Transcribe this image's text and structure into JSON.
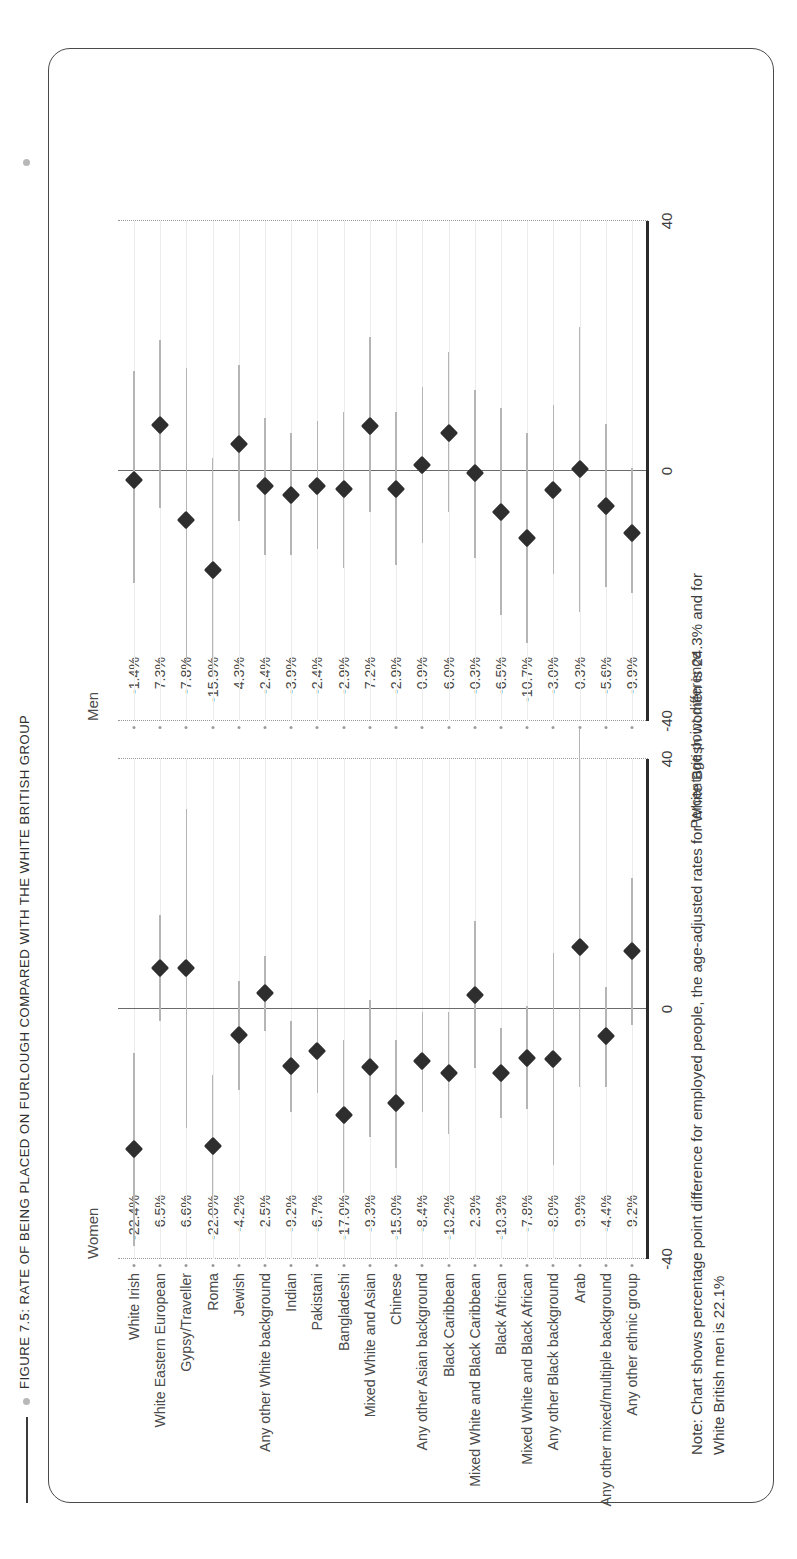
{
  "figure": {
    "title": "FIGURE 7.5: RATE OF BEING PLACED ON FURLOUGH COMPARED WITH THE WHITE BRITISH GROUP",
    "note_line1": "Note: Chart shows percentage point difference for employed people, the age-adjusted rates for White British women is 24.3% and for",
    "note_line2": "White British men is 22.1%"
  },
  "chart_data": {
    "type": "scatter",
    "title": "FIGURE 7.5: RATE OF BEING PLACED ON FURLOUGH COMPARED WITH THE WHITE BRITISH GROUP",
    "xlabel": "Percentage point difference",
    "ylabel": "",
    "xlim": [
      -40,
      40
    ],
    "xticks": [
      -40,
      0,
      40
    ],
    "xtick_labels": [
      "-40",
      "0",
      "40"
    ],
    "grid": true,
    "legend_position": "none",
    "panels": [
      {
        "name": "women",
        "label": "Women"
      },
      {
        "name": "men",
        "label": "Men"
      }
    ],
    "categories": [
      "White Irish",
      "White Eastern European",
      "Gypsy/Traveller",
      "Roma",
      "Jewish",
      "Any other White background",
      "Indian",
      "Pakistani",
      "Bangladeshi",
      "Mixed White and Asian",
      "Chinese",
      "Any other Asian background",
      "Black Caribbean",
      "Mixed White and Black Caribbean",
      "Black African",
      "Mixed White and Black African",
      "Any other Black background",
      "Arab",
      "Any other mixed/multiple background",
      "Any other ethnic group"
    ],
    "series": [
      {
        "name": "Women",
        "value_labels": [
          "-22.4%",
          "6.5%",
          "6.6%",
          "-22.0%",
          "-4.2%",
          "2.5%",
          "-9.2%",
          "-6.7%",
          "-17.0%",
          "-9.3%",
          "-15.0%",
          "-8.4%",
          "-10.2%",
          "2.3%",
          "-10.3%",
          "-7.8%",
          "-8.0%",
          "9.9%",
          "-4.4%",
          "9.2%"
        ],
        "values": [
          -22.4,
          6.5,
          6.6,
          -22.0,
          -4.2,
          2.5,
          -9.2,
          -6.7,
          -17.0,
          -9.3,
          -15.0,
          -8.4,
          -10.2,
          2.3,
          -10.3,
          -7.8,
          -8.0,
          9.9,
          -4.4,
          9.2
        ],
        "ci_low": [
          -38.0,
          -2.0,
          -19.0,
          -33.5,
          -13.0,
          -3.5,
          -16.5,
          -13.5,
          -29.5,
          -20.5,
          -25.5,
          -16.5,
          -20.0,
          -9.5,
          -17.5,
          -16.0,
          -25.0,
          -12.5,
          -12.5,
          -2.5
        ],
        "ci_high": [
          -7.0,
          15.0,
          32.0,
          -10.5,
          4.5,
          8.5,
          -2.0,
          0.0,
          -5.0,
          1.5,
          -5.0,
          -0.5,
          -0.5,
          14.0,
          -3.0,
          0.5,
          9.0,
          45.0,
          3.5,
          21.0
        ]
      },
      {
        "name": "Men",
        "value_labels": [
          "-1.4%",
          "7.3%",
          "-7.8%",
          "-15.9%",
          "4.3%",
          "-2.4%",
          "-3.9%",
          "-2.4%",
          "-2.9%",
          "7.2%",
          "-2.9%",
          "0.9%",
          "6.0%",
          "-0.3%",
          "-6.5%",
          "-10.7%",
          "-3.0%",
          "0.3%",
          "-5.6%",
          "-9.9%"
        ],
        "values": [
          -1.4,
          7.3,
          -7.8,
          -15.9,
          4.3,
          -2.4,
          -3.9,
          -2.4,
          -2.9,
          7.2,
          -2.9,
          0.9,
          6.0,
          -0.3,
          -6.5,
          -10.7,
          -3.0,
          0.3,
          -5.6,
          -9.9
        ],
        "ci_low": [
          -18.0,
          -6.0,
          -31.0,
          -33.0,
          -8.0,
          -13.5,
          -13.5,
          -12.5,
          -15.5,
          -6.5,
          -15.0,
          -11.5,
          -6.5,
          -14.0,
          -23.0,
          -27.5,
          -16.5,
          -22.5,
          -18.5,
          -19.5
        ],
        "ci_high": [
          16.0,
          21.0,
          16.5,
          2.0,
          17.0,
          8.5,
          6.0,
          8.0,
          9.5,
          21.5,
          9.5,
          13.5,
          19.0,
          13.0,
          10.0,
          6.0,
          10.5,
          23.0,
          7.5,
          0.5
        ]
      }
    ]
  }
}
